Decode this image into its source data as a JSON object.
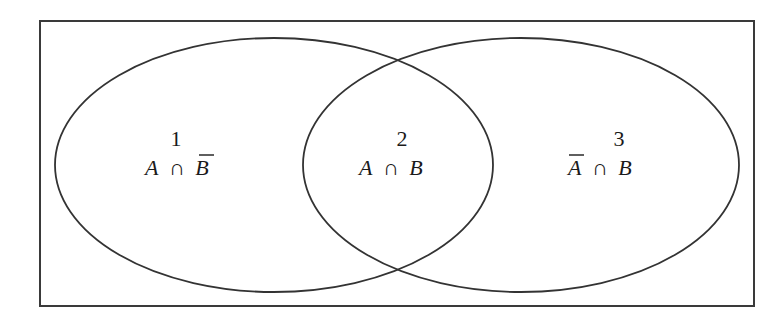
{
  "diagram": {
    "type": "venn",
    "colors": {
      "stroke": "#333333",
      "text": "#1a1a1a",
      "background": "#ffffff"
    },
    "sets": [
      {
        "name": "A",
        "position": "left"
      },
      {
        "name": "B",
        "position": "right"
      }
    ],
    "regions": [
      {
        "number": "1",
        "formula": {
          "left": "A",
          "op": "∩",
          "right": "B",
          "complement": "right"
        }
      },
      {
        "number": "2",
        "formula": {
          "left": "A",
          "op": "∩",
          "right": "B",
          "complement": "none"
        }
      },
      {
        "number": "3",
        "formula": {
          "left": "A",
          "op": "∩",
          "right": "B",
          "complement": "left"
        }
      }
    ]
  }
}
